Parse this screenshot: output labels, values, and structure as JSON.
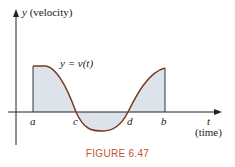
{
  "figure": {
    "caption": "FIGURE 6.47",
    "y_axis_label": "y",
    "y_axis_desc": "(velocity)",
    "x_axis_label": "t",
    "x_axis_desc": "(time)",
    "curve_label": "y = v(t)",
    "points": [
      "a",
      "c",
      "d",
      "b"
    ],
    "colors": {
      "curve": "#7a3a22",
      "fill": "#dde3ea",
      "caption": "#c0562b"
    }
  }
}
